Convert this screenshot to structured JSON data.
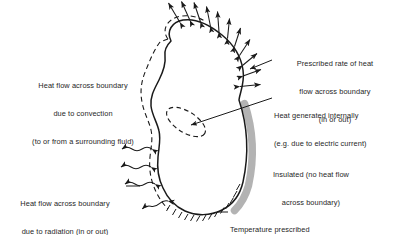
{
  "figure": {
    "type": "heat-transfer-boundary-conditions-diagram",
    "background_color": "#ffffff",
    "ink_color": "#1a1a1a",
    "text_color": "#262626",
    "insulation_band_color": "#b3b3b3"
  },
  "body_region": {
    "name": "conducting-body",
    "fill": "#ffffff",
    "stroke": "#1a1a1a"
  },
  "labels": {
    "convection": {
      "name": "convection-label",
      "lines": [
        "Heat flow across boundary",
        "due to convection",
        "(to or from a surrounding fluid)"
      ],
      "align": "center"
    },
    "prescribed_flux": {
      "name": "prescribed-flux-label",
      "lines": [
        "Prescribed rate of heat",
        "flow across boundary",
        "(in or out)"
      ],
      "align": "center"
    },
    "internal_generation": {
      "name": "internal-heat-generation-label",
      "lines": [
        "Heat generated internally",
        "(e.g. due to electric current)"
      ],
      "align": "left"
    },
    "insulated": {
      "name": "insulated-label",
      "lines": [
        "Insulated (no heat flow",
        "across boundary)"
      ],
      "align": "center"
    },
    "radiation": {
      "name": "radiation-label",
      "lines": [
        "Heat flow across boundary",
        "due to radiation (in or out)"
      ],
      "align": "center"
    },
    "temperature": {
      "name": "temperature-prescribed-label",
      "lines": [
        "Temperature prescribed"
      ],
      "align": "left"
    }
  },
  "annotations": {
    "convection_dashed_boundary": "dashed-line-parallel-to-left-boundary",
    "flux_arrows": "double-headed-straight-arrows-normal-to-top-boundary",
    "radiation_arrows": "wavy-double-headed-arrows-on-lower-left-boundary",
    "internal_source": "dashed-tilted-ellipse-inside-body",
    "insulated_edge": "thick-gray-band-along-right-lower-boundary",
    "temperature_edge": "cross-hatched-ticks-along-bottom-boundary"
  }
}
